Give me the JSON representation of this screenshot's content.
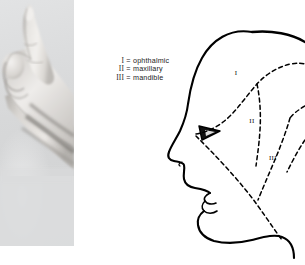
{
  "figure": {
    "background_color": "#ffffff"
  },
  "photo": {
    "name": "pointing-hand-photograph",
    "description": "Black and white photograph of a left hand with the index finger extended upward",
    "background_color": "#d9dadb",
    "skin_tone": "#e8e6e3"
  },
  "legend": {
    "name": "trigeminal-division-legend",
    "entries": [
      {
        "numeral": "I",
        "equals": "=",
        "term": "ophthalmic"
      },
      {
        "numeral": "II",
        "equals": "=",
        "term": "maxillary"
      },
      {
        "numeral": "III",
        "equals": "=",
        "term": "mandible"
      }
    ]
  },
  "diagram": {
    "name": "head-profile-diagram",
    "outline_color": "#000000",
    "division_line_style": "dashed",
    "zone_labels": [
      {
        "id": "I",
        "text": "I",
        "x": 76,
        "y": 75
      },
      {
        "id": "II",
        "text": "II",
        "x": 92,
        "y": 123
      },
      {
        "id": "III",
        "text": "III",
        "x": 113,
        "y": 160
      }
    ],
    "features": {
      "eye": "dark triangular eye marking",
      "nose": "profile nose with nostril",
      "lips": "upper and lower lip profile",
      "chin": "chin and jawline",
      "neck": "neck contour"
    }
  }
}
